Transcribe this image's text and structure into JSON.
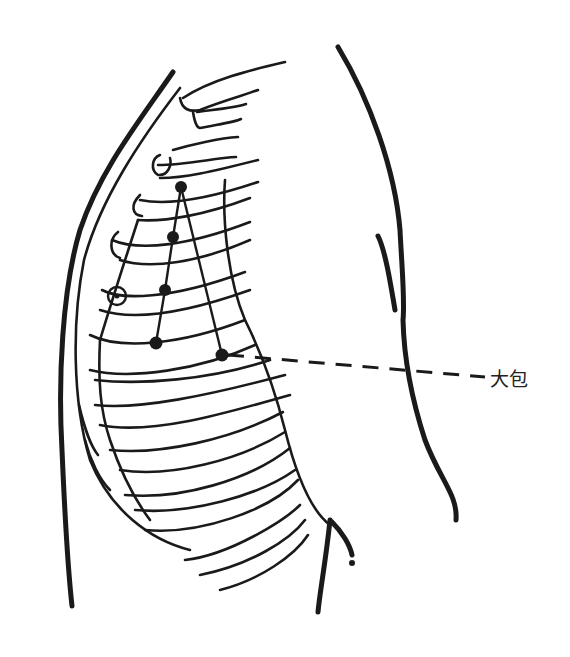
{
  "figure": {
    "type": "acupoint-illustration",
    "label": "大包",
    "colors": {
      "ink": "#1a1a1a",
      "background": "#ffffff"
    }
  },
  "points": [
    {
      "x": 181,
      "y": 187
    },
    {
      "x": 173,
      "y": 237
    },
    {
      "x": 165,
      "y": 290
    },
    {
      "x": 156,
      "y": 343
    },
    {
      "x": 222,
      "y": 355
    }
  ],
  "nipple": {
    "x": 117,
    "y": 296
  }
}
